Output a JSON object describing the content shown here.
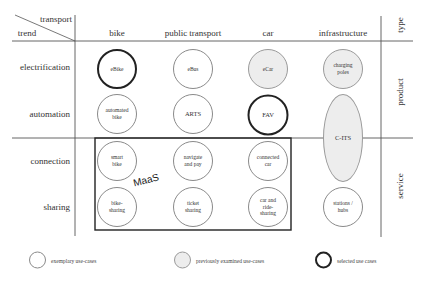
{
  "corner": {
    "column_axis_label": "transport",
    "row_axis_label": "trend"
  },
  "columns": [
    {
      "label": "bike"
    },
    {
      "label": "public transport"
    },
    {
      "label": "car"
    },
    {
      "label": "infrastructure"
    }
  ],
  "type_column": {
    "header": "type",
    "groups": [
      {
        "label": "product"
      },
      {
        "label": "service"
      }
    ]
  },
  "rows": [
    {
      "label": "electrification"
    },
    {
      "label": "automation"
    },
    {
      "label": "connection"
    },
    {
      "label": "sharing"
    }
  ],
  "cells": {
    "electrification_bike": {
      "label": "eBike",
      "style": "selected"
    },
    "electrification_public": {
      "label": "eBus",
      "style": "exemplary"
    },
    "electrification_car": {
      "label": "eCar",
      "style": "previously-examined"
    },
    "electrification_infra": {
      "label": "charging poles",
      "style": "previously-examined"
    },
    "automation_bike": {
      "label": "automated bike",
      "style": "exemplary"
    },
    "automation_public": {
      "label": "ARTS",
      "style": "exemplary"
    },
    "automation_car": {
      "label": "FAV",
      "style": "selected"
    },
    "automation_connection_infra": {
      "label": "C-ITS",
      "style": "previously-examined"
    },
    "connection_bike": {
      "label": "smart bike",
      "style": "exemplary"
    },
    "connection_public": {
      "label": "navigate and pay",
      "style": "exemplary"
    },
    "connection_car": {
      "label": "connected car",
      "style": "exemplary"
    },
    "sharing_bike": {
      "label": "bike-sharing",
      "style": "exemplary"
    },
    "sharing_public": {
      "label": "ticket sharing",
      "style": "exemplary"
    },
    "sharing_car": {
      "label": "car and ride-sharing",
      "style": "exemplary"
    },
    "sharing_infra": {
      "label": "stations / hubs",
      "style": "exemplary"
    }
  },
  "grouping": {
    "label": "MaaS"
  },
  "legend": [
    {
      "label": "exemplary use-cases",
      "style": "exemplary"
    },
    {
      "label": "previously examined use-cases",
      "style": "previously-examined"
    },
    {
      "label": "selected use cases",
      "style": "selected"
    }
  ],
  "colors": {
    "line": "#555555",
    "filled": "#ededed",
    "outline": "#8a8a8a",
    "selected_outline": "#222222"
  }
}
